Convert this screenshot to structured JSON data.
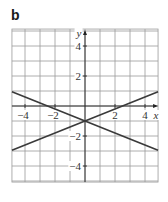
{
  "panel_label": "b",
  "chart_data": {
    "type": "line",
    "title": "",
    "xlabel": "x",
    "ylabel": "y",
    "xlim": [
      -4.87,
      4.87
    ],
    "ylim": [
      -5.07,
      5.13
    ],
    "grid": true,
    "grid_step": 1,
    "x_ticks": [
      -4,
      -2,
      2,
      4
    ],
    "x_tick_labels": [
      "−4",
      "−2",
      "2",
      "4"
    ],
    "y_ticks": [
      4,
      2,
      -2,
      -4
    ],
    "y_tick_labels": [
      "4",
      "2",
      "−2",
      "−4"
    ],
    "legend": [],
    "series": [
      {
        "name": "line 1",
        "equation": "y = -0.4x - 1",
        "x": [
          -4.87,
          4.87
        ],
        "y": [
          0.95,
          -2.95
        ]
      },
      {
        "name": "line 2",
        "equation": "y = 0.4x - 1",
        "x": [
          -4.87,
          4.87
        ],
        "y": [
          -2.95,
          0.95
        ]
      }
    ],
    "intersection": {
      "x": 0,
      "y": -1
    }
  }
}
